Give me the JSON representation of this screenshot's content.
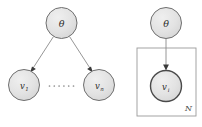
{
  "figure": {
    "background_color": "#ffffff",
    "node_fill_color": "#e2e2e2",
    "node_stroke_color": "#6f6f6f",
    "edge_color": "#8a8a8a",
    "plate_stroke_color": "#9a9a9a",
    "label_color": "#2b2b2b"
  },
  "left_panel": {
    "name": "expanded-graphical-model",
    "nodes": [
      {
        "id": "theta",
        "label": "θ",
        "cx": 61.5,
        "cy": 23,
        "r": 15.5,
        "style": "plain"
      },
      {
        "id": "v1",
        "label": "v",
        "sub": "1",
        "cx": 24,
        "cy": 85,
        "r": 15.5,
        "style": "plain"
      },
      {
        "id": "vn",
        "label": "v",
        "sub": "n",
        "cx": 99,
        "cy": 85,
        "r": 15.5,
        "style": "plain"
      }
    ],
    "edges": [
      {
        "from": "theta",
        "to": "v1",
        "arrow": true
      },
      {
        "from": "theta",
        "to": "vn",
        "arrow": true
      }
    ],
    "ellipsis": {
      "label": "......",
      "dots": 6,
      "cx": 61.5,
      "cy": 86
    }
  },
  "right_panel": {
    "name": "plate-notation-model",
    "nodes": [
      {
        "id": "theta",
        "label": "θ",
        "cx": 166,
        "cy": 23,
        "r": 15.5,
        "style": "plain"
      },
      {
        "id": "vi",
        "label": "v",
        "sub": "i",
        "cx": 166,
        "cy": 86,
        "r": 15.5,
        "style": "bold"
      }
    ],
    "edges": [
      {
        "from": "theta",
        "to": "vi",
        "arrow": true
      }
    ],
    "plate": {
      "label": "N",
      "x": 137,
      "y": 48,
      "width": 59,
      "height": 68,
      "label_x": 188.5,
      "label_y": 111
    }
  }
}
